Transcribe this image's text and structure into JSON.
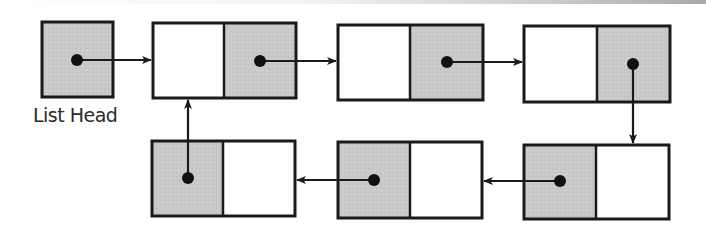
{
  "diagram": {
    "head_label": "List Head",
    "colors": {
      "pointer_cell": "#c8c8c8",
      "data_cell": "#ffffff",
      "stroke": "#1a1a1a"
    },
    "head": {
      "x": 42,
      "y": 22,
      "w": 71,
      "h": 75,
      "dot": [
        77,
        60
      ]
    },
    "nodes": [
      {
        "id": "node-1",
        "row": "top",
        "x": 153,
        "y": 23,
        "w": 143,
        "h": 75,
        "divider": 224,
        "pointer_side": "right",
        "dot": [
          260,
          61
        ]
      },
      {
        "id": "node-2",
        "row": "top",
        "x": 338,
        "y": 25,
        "w": 145,
        "h": 75,
        "divider": 410,
        "pointer_side": "right",
        "dot": [
          447,
          62
        ]
      },
      {
        "id": "node-3",
        "row": "top",
        "x": 524,
        "y": 26,
        "w": 146,
        "h": 76,
        "divider": 597,
        "pointer_side": "right",
        "dot": [
          633,
          64
        ]
      },
      {
        "id": "node-4",
        "row": "bottom",
        "x": 524,
        "y": 145,
        "w": 145,
        "h": 74,
        "divider": 596,
        "pointer_side": "left",
        "dot": [
          560,
          181
        ]
      },
      {
        "id": "node-5",
        "row": "bottom",
        "x": 338,
        "y": 142,
        "w": 144,
        "h": 76,
        "divider": 410,
        "pointer_side": "left",
        "dot": [
          374,
          180
        ]
      },
      {
        "id": "node-6",
        "row": "bottom",
        "x": 152,
        "y": 141,
        "w": 143,
        "h": 75,
        "divider": 223,
        "pointer_side": "left",
        "dot": [
          188,
          178
        ]
      }
    ],
    "arrows": [
      {
        "from": "head",
        "to": "node-1",
        "x1": 77,
        "y1": 60,
        "x2": 151,
        "y2": 60
      },
      {
        "from": "node-1",
        "to": "node-2",
        "x1": 260,
        "y1": 61,
        "x2": 336,
        "y2": 61
      },
      {
        "from": "node-2",
        "to": "node-3",
        "x1": 447,
        "y1": 62,
        "x2": 522,
        "y2": 62
      },
      {
        "from": "node-3",
        "to": "node-4",
        "x1": 633,
        "y1": 64,
        "x2": 633,
        "y2": 143
      },
      {
        "from": "node-4",
        "to": "node-5",
        "x1": 560,
        "y1": 181,
        "x2": 484,
        "y2": 181
      },
      {
        "from": "node-5",
        "to": "node-6",
        "x1": 374,
        "y1": 180,
        "x2": 297,
        "y2": 180
      },
      {
        "from": "node-6",
        "to": "node-1",
        "x1": 188,
        "y1": 178,
        "x2": 188,
        "y2": 100
      }
    ]
  }
}
